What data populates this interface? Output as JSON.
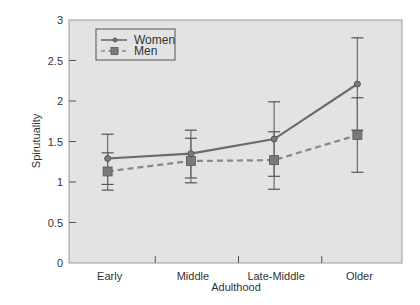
{
  "chart_data": {
    "type": "line",
    "title": "",
    "xlabel": "Adulthood",
    "ylabel": "Spirutuality",
    "categories": [
      "Early",
      "Middle",
      "Late-Middle",
      "Older"
    ],
    "ylim": [
      0,
      3
    ],
    "yticks": [
      0,
      0.5,
      1,
      1.5,
      2,
      2.5,
      3
    ],
    "ytick_labels": [
      "0",
      "0.5",
      "1",
      "1.5",
      "2",
      "2.5",
      "3"
    ],
    "grid": false,
    "legend_position": "upper left",
    "error_bars": true,
    "series": [
      {
        "name": "Women",
        "style": "solid",
        "marker": "circle",
        "color": "#6b6b6b",
        "values": [
          1.29,
          1.35,
          1.53,
          2.21
        ],
        "error_lower": [
          0.97,
          1.05,
          0.91,
          1.64
        ],
        "error_upper": [
          1.59,
          1.64,
          1.99,
          2.78
        ]
      },
      {
        "name": "Men",
        "style": "dashed",
        "marker": "square",
        "color": "#888888",
        "values": [
          1.13,
          1.26,
          1.27,
          1.58
        ],
        "error_lower": [
          0.9,
          0.99,
          1.07,
          1.12
        ],
        "error_upper": [
          1.36,
          1.54,
          1.62,
          2.04
        ]
      }
    ]
  },
  "colors": {
    "plot_background": "#e3e3e3",
    "axis": "#8a8a8a",
    "women_line": "#6b6b6b",
    "men_line": "#8a8a8a",
    "marker_fill": "#7a7a7a"
  }
}
